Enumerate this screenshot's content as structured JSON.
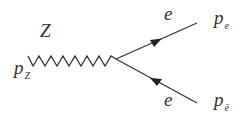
{
  "diagram": {
    "type": "feynman-vertex",
    "boson": {
      "label": "Z",
      "momentum": "p",
      "momentum_sub": "Z",
      "line_style": "zigzag"
    },
    "fermion_out": {
      "label": "e",
      "momentum": "p",
      "momentum_sub": "e",
      "arrow": "outgoing"
    },
    "fermion_in": {
      "label": "e",
      "momentum": "p",
      "momentum_sub": "ē",
      "arrow": "incoming"
    },
    "line_color": "#333333"
  }
}
